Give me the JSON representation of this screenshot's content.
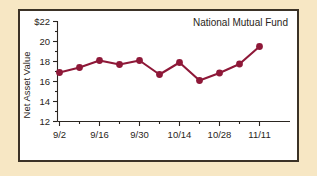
{
  "figure": {
    "background_color": "#f7e7c4",
    "plot_background_color": "#ffffff",
    "frame_color": "#3b3226"
  },
  "chart_data": {
    "type": "line",
    "title": "National Mutual Fund",
    "xlabel": "",
    "ylabel": "Net Asset Value",
    "x": [
      "9/2",
      "9/9",
      "9/16",
      "9/23",
      "9/30",
      "10/7",
      "10/14",
      "10/21",
      "10/28",
      "11/4",
      "11/11"
    ],
    "values": [
      16.9,
      17.4,
      18.1,
      17.7,
      18.1,
      16.7,
      17.9,
      16.1,
      16.85,
      17.75,
      19.5
    ],
    "series": [
      {
        "name": "National Mutual Fund",
        "color": "#8e1838",
        "values": [
          16.9,
          17.4,
          18.1,
          17.7,
          18.1,
          16.7,
          17.9,
          16.1,
          16.85,
          17.75,
          19.5
        ]
      }
    ],
    "xtick_labels": [
      "9/2",
      "9/16",
      "9/30",
      "10/14",
      "10/28",
      "11/11"
    ],
    "xtick_values": [
      0,
      2,
      4,
      6,
      8,
      10
    ],
    "ytick_labels": [
      "12",
      "14",
      "16",
      "18",
      "20",
      "$22"
    ],
    "ytick_values": [
      12,
      14,
      16,
      18,
      20,
      22
    ],
    "xlim": [
      -0.35,
      10.55
    ],
    "ylim": [
      11.55,
      22.45
    ],
    "grid": false,
    "legend": "none",
    "marker": "circle",
    "line_color": "#8e1838"
  }
}
